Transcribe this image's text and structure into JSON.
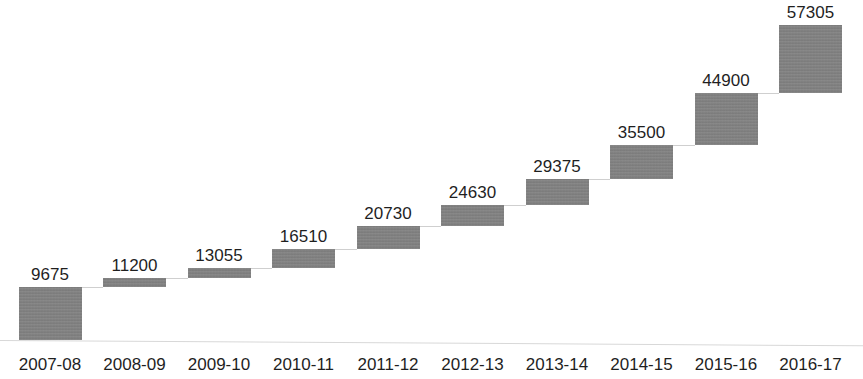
{
  "chart_data": {
    "type": "bar",
    "subtype": "waterfall",
    "title": "",
    "subtitle": "",
    "xlabel": "",
    "ylabel": "",
    "grid": false,
    "legend": null,
    "categories": [
      "2007-08",
      "2008-09",
      "2009-10",
      "2010-11",
      "2011-12",
      "2012-13",
      "2013-14",
      "2014-15",
      "2015-16",
      "2016-17"
    ],
    "values": [
      9675,
      11200,
      13055,
      16510,
      20730,
      24630,
      29375,
      35500,
      44900,
      57305
    ],
    "data_labels": [
      "9675",
      "11200",
      "13055",
      "16510",
      "20730",
      "24630",
      "29375",
      "35500",
      "44900",
      "57305"
    ],
    "ylim": [
      0,
      57305
    ],
    "bar_color": "#808080",
    "connector_color": "#cfcfcf",
    "axis_color": "#d8d8d8",
    "label_color": "#1f1f1f",
    "background": "#ffffff"
  }
}
